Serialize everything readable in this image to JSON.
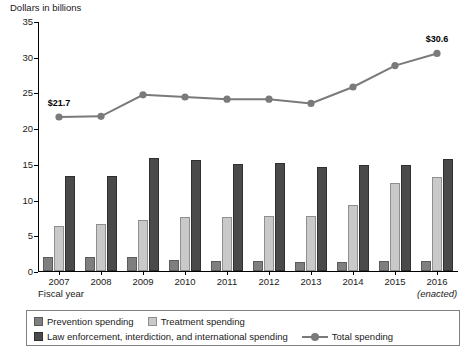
{
  "chart_data": {
    "type": "bar",
    "title": "",
    "ylabel": "Dollars in billions",
    "xlabel": "Fiscal year",
    "ylim": [
      0,
      35
    ],
    "yticks": [
      0,
      5,
      10,
      15,
      20,
      25,
      30,
      35
    ],
    "grid": false,
    "legend_position": "bottom",
    "categories": [
      "2007",
      "2008",
      "2009",
      "2010",
      "2011",
      "2012",
      "2013",
      "2014",
      "2015",
      "2016"
    ],
    "category_sublabels": [
      "",
      "",
      "",
      "",
      "",
      "",
      "",
      "",
      "",
      "(enacted)"
    ],
    "series": [
      {
        "name": "Prevention spending",
        "type": "bar",
        "color": "#7f7f7f",
        "values": [
          1.9,
          1.9,
          1.9,
          1.5,
          1.4,
          1.4,
          1.3,
          1.3,
          1.4,
          1.4
        ]
      },
      {
        "name": "Treatment spending",
        "type": "bar",
        "color": "#c9c9c9",
        "values": [
          6.3,
          6.6,
          7.1,
          7.5,
          7.6,
          7.7,
          7.7,
          9.3,
          12.3,
          13.1
        ]
      },
      {
        "name": "Law enforcement, interdiction, and international spending",
        "type": "bar",
        "color": "#4a4a4a",
        "values": [
          13.3,
          13.3,
          15.8,
          15.5,
          15.0,
          15.1,
          14.6,
          14.8,
          14.9,
          15.7
        ]
      },
      {
        "name": "Total spending",
        "type": "line",
        "color": "#7a7a7a",
        "values": [
          21.7,
          21.8,
          24.8,
          24.5,
          24.2,
          24.2,
          23.6,
          25.9,
          28.9,
          30.6
        ]
      }
    ],
    "annotations": [
      {
        "text": "$21.7",
        "category": "2007",
        "value": 21.7
      },
      {
        "text": "$30.6",
        "category": "2016",
        "value": 30.6
      }
    ]
  },
  "legend": {
    "items": [
      {
        "label": "Prevention spending",
        "marker": "square-swatch-prevention"
      },
      {
        "label": "Treatment spending",
        "marker": "square-swatch-treatment"
      },
      {
        "label": "Law enforcement, interdiction, and international spending",
        "marker": "square-swatch-law"
      },
      {
        "label": "Total spending",
        "marker": "line-marker-total"
      }
    ]
  }
}
